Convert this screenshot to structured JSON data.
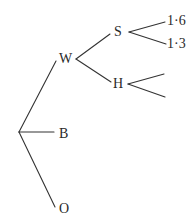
{
  "diagram": {
    "type": "tree",
    "line_color": "#333333",
    "root": {
      "label": "",
      "children": [
        {
          "label": "W",
          "children": [
            {
              "label": "S",
              "children": [
                {
                  "label": "1·6"
                },
                {
                  "label": "1·3"
                }
              ]
            },
            {
              "label": "H",
              "children": [
                {
                  "label": ""
                },
                {
                  "label": ""
                }
              ]
            }
          ]
        },
        {
          "label": "B"
        },
        {
          "label": "O"
        }
      ]
    }
  },
  "labels": {
    "w": "W",
    "s": "S",
    "h": "H",
    "b": "B",
    "o": "O",
    "s_leaf_1": "1·6",
    "s_leaf_2": "1·3"
  }
}
